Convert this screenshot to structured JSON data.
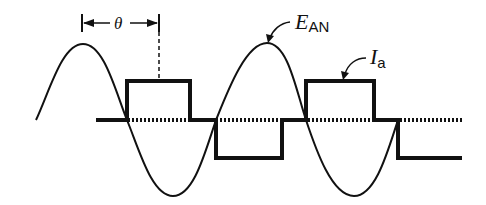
{
  "diagram": {
    "type": "waveform",
    "labels": {
      "theta": "θ",
      "voltage_main": "E",
      "voltage_sub": "AN",
      "current_main": "I",
      "current_sub": "a"
    },
    "colors": {
      "stroke": "#111111",
      "background": "#ffffff"
    },
    "geometry": {
      "baseline_y": 120,
      "square_top_y": 81,
      "square_bottom_y": 158,
      "sine_peak_y": 44,
      "sine_trough_y": 196
    }
  }
}
